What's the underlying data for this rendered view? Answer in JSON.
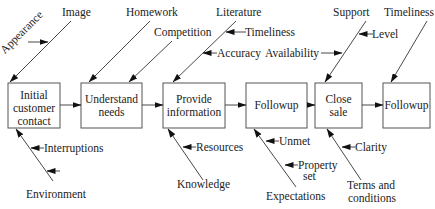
{
  "diagram": {
    "type": "cause-and-effect process flow",
    "steps": [
      {
        "id": "s1",
        "lines": [
          "Initial",
          "customer",
          "contact"
        ]
      },
      {
        "id": "s2",
        "lines": [
          "Understand",
          "needs"
        ]
      },
      {
        "id": "s3",
        "lines": [
          "Provide",
          "information"
        ]
      },
      {
        "id": "s4",
        "lines": [
          "Followup"
        ]
      },
      {
        "id": "s5",
        "lines": [
          "Close",
          "sale"
        ]
      },
      {
        "id": "s6",
        "lines": [
          "Followup"
        ]
      }
    ],
    "causes": {
      "s1_top": {
        "main": "Image",
        "sub": [
          "Appearance"
        ]
      },
      "s1_bottom": {
        "main": "Environment",
        "sub": [
          "Interruptions",
          ""
        ]
      },
      "s2_top": [
        {
          "main": "Homework"
        },
        {
          "main": "Competition"
        }
      ],
      "s3_top": {
        "main": "Literature",
        "sub": [
          "Timeliness",
          "Accuracy"
        ]
      },
      "s3_bottom": {
        "main": "Knowledge",
        "sub": [
          "Resources"
        ]
      },
      "s4_bottom": {
        "main": "Expectations",
        "sub": [
          "Unmet",
          "Property set"
        ]
      },
      "s5_top": {
        "main": "Support",
        "sub": [
          "Level",
          "Availability"
        ]
      },
      "s5_bottom": {
        "main": "Terms and conditions",
        "sub": [
          "Clarity"
        ]
      },
      "s6_top": {
        "main": "Timeliness"
      }
    }
  },
  "labels": {
    "image": "Image",
    "appearance": "Appearance",
    "homework": "Homework",
    "competition": "Competition",
    "literature": "Literature",
    "timeliness1": "Timeliness",
    "accuracy": "Accuracy",
    "availability": "Availability",
    "support": "Support",
    "level": "Level",
    "timeliness2": "Timeliness",
    "interruptions": "Interruptions",
    "environment": "Environment",
    "resources": "Resources",
    "knowledge": "Knowledge",
    "unmet": "Unmet",
    "property1": "Property",
    "property2": "set",
    "expectations": "Expectations",
    "clarity": "Clarity",
    "terms1": "Terms and",
    "terms2": "conditions",
    "s1a": "Initial",
    "s1b": "customer",
    "s1c": "contact",
    "s2a": "Understand",
    "s2b": "needs",
    "s3a": "Provide",
    "s3b": "information",
    "s4": "Followup",
    "s5a": "Close",
    "s5b": "sale",
    "s6": "Followup"
  }
}
